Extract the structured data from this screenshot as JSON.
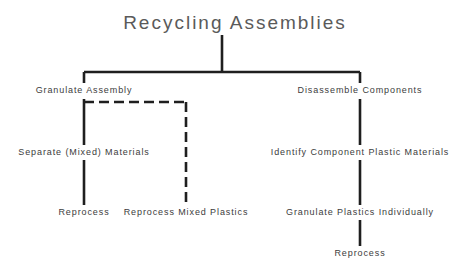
{
  "diagram": {
    "title": "Recycling  Assemblies",
    "stroke_color": "#1f1f1f",
    "title_color": "#5a5a5a",
    "label_color": "#3c3c3c",
    "background_color": "#ffffff",
    "nodes": [
      {
        "id": "granulate-assembly",
        "label": "Granulate  Assembly",
        "x": 84,
        "y": 90
      },
      {
        "id": "separate-mixed-materials",
        "label": "Separate  (Mixed)  Materials",
        "x": 84,
        "y": 152
      },
      {
        "id": "reprocess-left",
        "label": "Reprocess",
        "x": 84,
        "y": 212
      },
      {
        "id": "reprocess-mixed-plastics",
        "label": "Reprocess  Mixed  Plastics",
        "x": 186,
        "y": 212
      },
      {
        "id": "disassemble-components",
        "label": "Disassemble  Components",
        "x": 360,
        "y": 90
      },
      {
        "id": "identify-component-plastics",
        "label": "Identify  Component  Plastic  Materials",
        "x": 360,
        "y": 152
      },
      {
        "id": "granulate-plastics-individually",
        "label": "Granulate  Plastics  Individually",
        "x": 360,
        "y": 212
      },
      {
        "id": "reprocess-right",
        "label": "Reprocess",
        "x": 360,
        "y": 253
      }
    ],
    "connectors": [
      {
        "id": "root-stem",
        "style": "solid",
        "x1": 222,
        "y1": 35,
        "x2": 222,
        "y2": 72
      },
      {
        "id": "root-crossbar",
        "style": "solid",
        "x1": 84,
        "y1": 72,
        "x2": 360,
        "y2": 72
      },
      {
        "id": "left-branch-drop",
        "style": "solid",
        "x1": 84,
        "y1": 72,
        "x2": 84,
        "y2": 83
      },
      {
        "id": "right-branch-drop",
        "style": "solid",
        "x1": 360,
        "y1": 72,
        "x2": 360,
        "y2": 83
      },
      {
        "id": "left-trunk-upper",
        "style": "solid",
        "x1": 84,
        "y1": 99,
        "x2": 84,
        "y2": 145
      },
      {
        "id": "left-trunk-lower",
        "style": "solid",
        "x1": 84,
        "y1": 160,
        "x2": 84,
        "y2": 205
      },
      {
        "id": "dashed-crossbar",
        "style": "dashed",
        "x1": 84,
        "y1": 102,
        "x2": 186,
        "y2": 102
      },
      {
        "id": "dashed-right-drop",
        "style": "dashed",
        "x1": 186,
        "y1": 102,
        "x2": 186,
        "y2": 205
      },
      {
        "id": "right-trunk-upper",
        "style": "solid",
        "x1": 360,
        "y1": 99,
        "x2": 360,
        "y2": 145
      },
      {
        "id": "right-trunk-middle",
        "style": "solid",
        "x1": 360,
        "y1": 160,
        "x2": 360,
        "y2": 205
      },
      {
        "id": "right-trunk-lower",
        "style": "solid",
        "x1": 360,
        "y1": 220,
        "x2": 360,
        "y2": 246
      }
    ],
    "title_position": {
      "x": 235,
      "y": 22
    }
  }
}
